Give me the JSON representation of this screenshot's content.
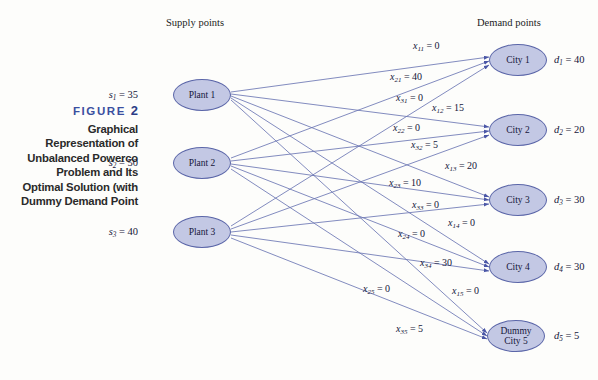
{
  "figure": {
    "label": "FIGURE",
    "number": "2",
    "caption_lines": [
      "Graphical",
      "Representation of",
      "Unbalanced Powerco",
      "Problem and Its",
      "Optimal Solution (with",
      "Dummy Demand Point"
    ]
  },
  "headings": {
    "supply": "Supply points",
    "demand": "Demand points"
  },
  "colors": {
    "node_fill": "#c3c8e4",
    "node_stroke": "#5b66a8",
    "edge": "#6b76b4",
    "figure_blue": "#3a4fa0",
    "background": "#fdfdfb"
  },
  "supply_nodes": [
    {
      "id": "plant1",
      "label": "Plant 1",
      "value_var": "s",
      "value_sub": "1",
      "value": "35",
      "value_text": "s1 = 35"
    },
    {
      "id": "plant2",
      "label": "Plant 2",
      "value_var": "s",
      "value_sub": "2",
      "value": "50",
      "value_text": "s2 = 50"
    },
    {
      "id": "plant3",
      "label": "Plant 3",
      "value_var": "s",
      "value_sub": "3",
      "value": "40",
      "value_text": "s3 = 40"
    }
  ],
  "demand_nodes": [
    {
      "id": "city1",
      "label": "City 1",
      "label2": "",
      "value_var": "d",
      "value_sub": "1",
      "value": "40",
      "value_text": "d1 = 40"
    },
    {
      "id": "city2",
      "label": "City 2",
      "label2": "",
      "value_var": "d",
      "value_sub": "2",
      "value": "20",
      "value_text": "d2 = 20"
    },
    {
      "id": "city3",
      "label": "City 3",
      "label2": "",
      "value_var": "d",
      "value_sub": "3",
      "value": "30",
      "value_text": "d3 = 30"
    },
    {
      "id": "city4",
      "label": "City 4",
      "label2": "",
      "value_var": "d",
      "value_sub": "4",
      "value": "30",
      "value_text": "d4 = 30"
    },
    {
      "id": "city5",
      "label": "Dummy",
      "label2": "City 5",
      "value_var": "d",
      "value_sub": "5",
      "value": "5",
      "value_text": "d5 = 5"
    }
  ],
  "chart_data": {
    "type": "diagram",
    "title": "Graphical Representation of Unbalanced Powerco Problem and Its Optimal Solution (with Dummy Demand Point",
    "supply": [
      {
        "node": "Plant 1",
        "s": 35
      },
      {
        "node": "Plant 2",
        "s": 50
      },
      {
        "node": "Plant 3",
        "s": 40
      }
    ],
    "demand": [
      {
        "node": "City 1",
        "d": 40
      },
      {
        "node": "City 2",
        "d": 20
      },
      {
        "node": "City 3",
        "d": 30
      },
      {
        "node": "City 4",
        "d": 30
      },
      {
        "node": "Dummy City 5",
        "d": 5
      }
    ],
    "flows": [
      {
        "from": "Plant 1",
        "to": "City 1",
        "var": "x11",
        "value": 0
      },
      {
        "from": "Plant 2",
        "to": "City 1",
        "var": "x21",
        "value": 40
      },
      {
        "from": "Plant 3",
        "to": "City 1",
        "var": "x31",
        "value": 0
      },
      {
        "from": "Plant 1",
        "to": "City 2",
        "var": "x12",
        "value": 15
      },
      {
        "from": "Plant 2",
        "to": "City 2",
        "var": "x22",
        "value": 0
      },
      {
        "from": "Plant 3",
        "to": "City 2",
        "var": "x32",
        "value": 5
      },
      {
        "from": "Plant 1",
        "to": "City 3",
        "var": "x13",
        "value": 20
      },
      {
        "from": "Plant 2",
        "to": "City 3",
        "var": "x23",
        "value": 10
      },
      {
        "from": "Plant 3",
        "to": "City 3",
        "var": "x33",
        "value": 0
      },
      {
        "from": "Plant 1",
        "to": "City 4",
        "var": "x14",
        "value": 0
      },
      {
        "from": "Plant 2",
        "to": "City 4",
        "var": "x24",
        "value": 0
      },
      {
        "from": "Plant 3",
        "to": "City 4",
        "var": "x34",
        "value": 30
      },
      {
        "from": "Plant 1",
        "to": "Dummy City 5",
        "var": "x15",
        "value": 0
      },
      {
        "from": "Plant 2",
        "to": "Dummy City 5",
        "var": "x25",
        "value": 0
      },
      {
        "from": "Plant 3",
        "to": "Dummy City 5",
        "var": "x35",
        "value": 5
      }
    ]
  },
  "edge_labels": [
    {
      "id": "x11",
      "var": "x",
      "sub": "11",
      "value": "0",
      "text": "x11 = 0",
      "x": 413,
      "y": 40
    },
    {
      "id": "x21",
      "var": "x",
      "sub": "21",
      "value": "40",
      "text": "x21 = 40",
      "x": 390,
      "y": 71
    },
    {
      "id": "x31",
      "var": "x",
      "sub": "31",
      "value": "0",
      "text": "x31 = 0",
      "x": 396,
      "y": 92
    },
    {
      "id": "x12",
      "var": "x",
      "sub": "12",
      "value": "15",
      "text": "x12 = 15",
      "x": 432,
      "y": 102
    },
    {
      "id": "x22",
      "var": "x",
      "sub": "22",
      "value": "0",
      "text": "x22 = 0",
      "x": 393,
      "y": 122
    },
    {
      "id": "x32",
      "var": "x",
      "sub": "32",
      "value": "5",
      "text": "x32 = 5",
      "x": 411,
      "y": 139
    },
    {
      "id": "x13",
      "var": "x",
      "sub": "13",
      "value": "20",
      "text": "x13 = 20",
      "x": 445,
      "y": 160
    },
    {
      "id": "x23",
      "var": "x",
      "sub": "23",
      "value": "10",
      "text": "x23 = 10",
      "x": 389,
      "y": 177
    },
    {
      "id": "x33",
      "var": "x",
      "sub": "33",
      "value": "0",
      "text": "x33 = 0",
      "x": 412,
      "y": 199
    },
    {
      "id": "x14",
      "var": "x",
      "sub": "14",
      "value": "0",
      "text": "x14 = 0",
      "x": 448,
      "y": 217
    },
    {
      "id": "x24",
      "var": "x",
      "sub": "24",
      "value": "0",
      "text": "x24 = 0",
      "x": 398,
      "y": 228
    },
    {
      "id": "x34",
      "var": "x",
      "sub": "34",
      "value": "30",
      "text": "x34 = 30",
      "x": 420,
      "y": 257
    },
    {
      "id": "x15",
      "var": "x",
      "sub": "15",
      "value": "0",
      "text": "x15 = 0",
      "x": 452,
      "y": 285
    },
    {
      "id": "x25",
      "var": "x",
      "sub": "25",
      "value": "0",
      "text": "x25 = 0",
      "x": 363,
      "y": 283
    },
    {
      "id": "x35",
      "var": "x",
      "sub": "35",
      "value": "5",
      "text": "x35 = 5",
      "x": 396,
      "y": 323
    }
  ]
}
